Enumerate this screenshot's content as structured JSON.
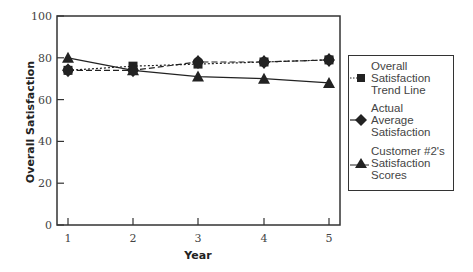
{
  "chart_data": {
    "type": "line",
    "title": "",
    "xlabel": "Year",
    "ylabel": "Overall Satisfaction",
    "x": [
      1,
      2,
      3,
      4,
      5
    ],
    "x_tick_labels": [
      "1",
      "2",
      "3",
      "4",
      "5"
    ],
    "y_tick_labels": [
      "0",
      "20",
      "40",
      "60",
      "80",
      "100"
    ],
    "ylim": [
      0,
      100
    ],
    "xlim": [
      0.85,
      5.15
    ],
    "grid": false,
    "legend_position": "right",
    "series": [
      {
        "name": "Overall Satisfaction Trend Line",
        "marker": "square",
        "line": "dotted",
        "values": [
          74,
          76,
          77,
          78,
          79
        ]
      },
      {
        "name": "Actual Average Satisfaction",
        "marker": "diamond",
        "line": "dashed",
        "values": [
          74,
          74,
          78,
          78,
          79
        ]
      },
      {
        "name": "Customer #2's Satisfaction Scores",
        "marker": "triangle",
        "line": "solid",
        "values": [
          80,
          74,
          71,
          70,
          68
        ]
      }
    ]
  },
  "legend": {
    "items": [
      {
        "lines": [
          "Overall",
          "Satisfaction",
          "Trend Line"
        ]
      },
      {
        "lines": [
          "Actual",
          "Average",
          "Satisfaction"
        ]
      },
      {
        "lines": [
          "Customer #2's",
          "Satisfaction",
          "Scores"
        ]
      }
    ]
  },
  "colors": {
    "ink": "#222222",
    "axis": "#333333",
    "text": "#444444",
    "background": "#ffffff"
  }
}
